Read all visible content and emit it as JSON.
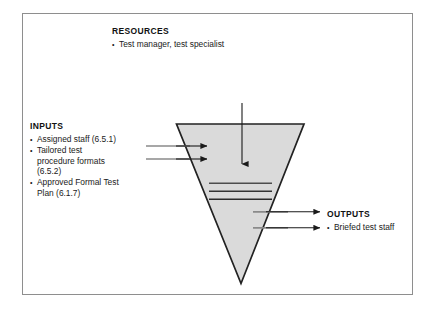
{
  "figure": {
    "type": "inverted-triangle-process-diagram",
    "background_color": "#ffffff",
    "frame_border_color": "#8e8e8e",
    "triangle_fill_color": "#dadada",
    "triangle_stroke_color": "#222222",
    "arrow_color": "#1a1a1a",
    "gray_line_color": "#8a8a8a"
  },
  "resources": {
    "heading": "RESOURCES",
    "items": [
      {
        "text": "Test manager, test specialist"
      }
    ]
  },
  "inputs": {
    "heading": "INPUTS",
    "items": [
      {
        "text": "Assigned staff (6.5.1)",
        "continuation": []
      },
      {
        "text": "Tailored test",
        "continuation": [
          "procedure formats",
          "(6.5.2)"
        ]
      },
      {
        "text": "Approved Formal Test",
        "continuation": [
          "Plan (6.1.7)"
        ]
      }
    ]
  },
  "outputs": {
    "heading": "OUTPUTS",
    "items": [
      {
        "text": "Briefed test staff"
      }
    ]
  },
  "process_lines": {
    "count": 3,
    "description": "three horizontal rules inside the triangle"
  },
  "arrows": {
    "resources_arrow": {
      "direction": "down",
      "count": 1
    },
    "input_arrows": {
      "direction": "right",
      "count": 2
    },
    "output_arrows": {
      "direction": "right",
      "count": 2
    }
  }
}
